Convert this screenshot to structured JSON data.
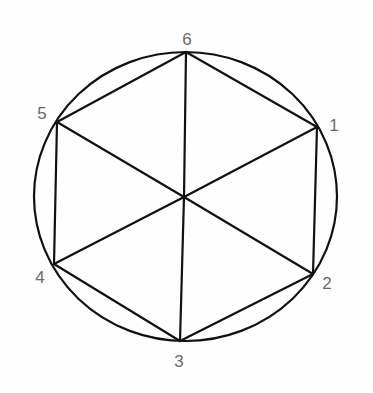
{
  "diagram": {
    "type": "hexagon-inscribed-in-circle",
    "colors": {
      "line": "#111111",
      "label": "#6a6a6a",
      "background": "#fefefe"
    },
    "circle": {
      "cx": 185.5,
      "cy": 196.5,
      "rx": 151.5,
      "ry": 144.5
    },
    "center": {
      "x": 184,
      "y": 197
    },
    "vertices": [
      {
        "id": "1",
        "label": "1",
        "x": 317,
        "y": 127,
        "label_x": 334,
        "label_y": 131
      },
      {
        "id": "2",
        "label": "2",
        "x": 313,
        "y": 274,
        "label_x": 327,
        "label_y": 289
      },
      {
        "id": "3",
        "label": "3",
        "x": 180,
        "y": 341,
        "label_x": 179,
        "label_y": 367
      },
      {
        "id": "4",
        "label": "4",
        "x": 54,
        "y": 264,
        "label_x": 40,
        "label_y": 283
      },
      {
        "id": "5",
        "label": "5",
        "x": 57,
        "y": 122,
        "label_x": 42,
        "label_y": 119
      },
      {
        "id": "6",
        "label": "6",
        "x": 186,
        "y": 52,
        "label_x": 187,
        "label_y": 45
      }
    ],
    "perimeter_edges": [
      [
        "6",
        "1"
      ],
      [
        "1",
        "2"
      ],
      [
        "2",
        "3"
      ],
      [
        "3",
        "4"
      ],
      [
        "4",
        "5"
      ],
      [
        "5",
        "6"
      ]
    ],
    "spokes": [
      "1",
      "2",
      "3",
      "4",
      "5",
      "6"
    ]
  }
}
